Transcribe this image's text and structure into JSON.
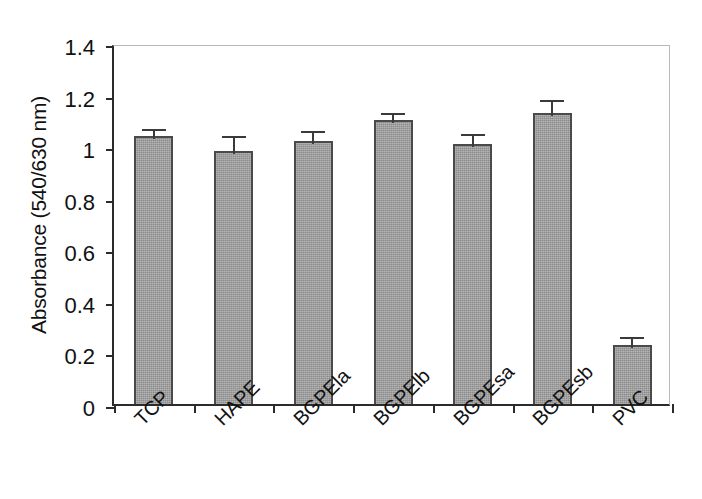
{
  "chart_data": {
    "type": "bar",
    "title": "",
    "xlabel": "",
    "ylabel": "Absorbance (540/630 nm)",
    "categories": [
      "TCP",
      "HAPE",
      "BGPEla",
      "BGPElb",
      "BGPEsa",
      "BGPEsb",
      "PVC"
    ],
    "values": [
      1.04,
      0.98,
      1.02,
      1.1,
      1.01,
      1.13,
      0.23
    ],
    "errors": [
      0.04,
      0.07,
      0.05,
      0.04,
      0.05,
      0.06,
      0.04
    ],
    "ylim": [
      0,
      1.4
    ],
    "ytick_values": [
      0,
      0.2,
      0.4,
      0.6,
      0.8,
      1.0,
      1.2,
      1.4
    ],
    "ytick_labels": [
      "0",
      "0.2",
      "0.4",
      "0.6",
      "0.8",
      "1",
      "1.2",
      "1.4"
    ],
    "grid": false,
    "legend": null,
    "bar_color": "#9a9a9a",
    "bar_edge_color": "#4a4a4a",
    "axis_color": "#2b2b2b",
    "frame_color": "#b9b9b9"
  },
  "axis": {
    "y_title": "Absorbance (540/630 nm)"
  }
}
